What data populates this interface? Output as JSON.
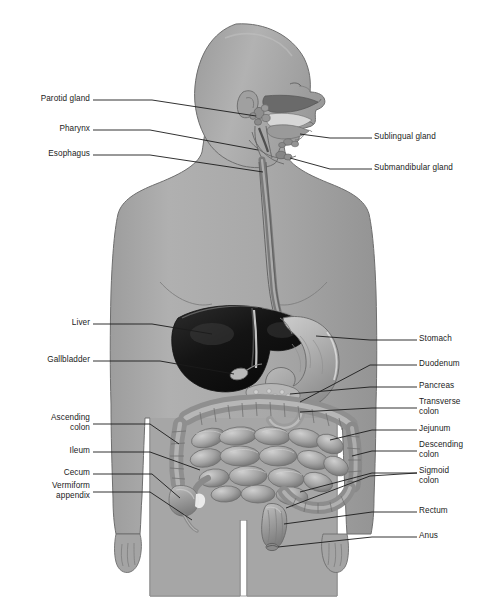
{
  "figure": {
    "title_fragment": "",
    "background_color": "#ffffff",
    "body_fill": "#a9a9a9",
    "body_outline": "#6d6d6d",
    "liver_color": "#1d1d1d",
    "stomach_color": "#b4b4b4",
    "intestine_color": "#9b9b9b",
    "leader_color": "#1b1b1b",
    "label_color": "#1b1b1b"
  },
  "labels_left": [
    {
      "name": "parotid-gland",
      "text": "Parotid gland",
      "x": 14,
      "y": 96,
      "w": 76,
      "lines": 1
    },
    {
      "name": "pharynx",
      "text": "Pharynx",
      "x": 14,
      "y": 126,
      "w": 76,
      "lines": 1
    },
    {
      "name": "esophagus",
      "text": "Esophagus",
      "x": 14,
      "y": 151,
      "w": 76,
      "lines": 1
    },
    {
      "name": "liver",
      "text": "Liver",
      "x": 14,
      "y": 320,
      "w": 76,
      "lines": 1
    },
    {
      "name": "gallbladder",
      "text": "Gallbladder",
      "x": 14,
      "y": 357,
      "w": 76,
      "lines": 1
    },
    {
      "name": "ascending-colon",
      "text": "Ascending\ncolon",
      "x": 14,
      "y": 419,
      "w": 76,
      "lines": 2
    },
    {
      "name": "ileum",
      "text": "Ileum",
      "x": 14,
      "y": 448,
      "w": 76,
      "lines": 1
    },
    {
      "name": "cecum",
      "text": "Cecum",
      "x": 14,
      "y": 470,
      "w": 76,
      "lines": 1
    },
    {
      "name": "vermiform-appendix",
      "text": "Vermiform\nappendix",
      "x": 14,
      "y": 487,
      "w": 76,
      "lines": 2
    }
  ],
  "labels_right": [
    {
      "name": "sublingual-gland",
      "text": "Sublingual gland",
      "x": 374,
      "y": 134,
      "lines": 1
    },
    {
      "name": "submandibular-gland",
      "text": "Submandibular gland",
      "x": 374,
      "y": 165,
      "lines": 1
    },
    {
      "name": "stomach",
      "text": "Stomach",
      "x": 419,
      "y": 336,
      "lines": 1
    },
    {
      "name": "duodenum",
      "text": "Duodenum",
      "x": 419,
      "y": 361,
      "lines": 1
    },
    {
      "name": "pancreas",
      "text": "Pancreas",
      "x": 419,
      "y": 383,
      "lines": 1
    },
    {
      "name": "transverse-colon",
      "text": "Transverse\ncolon",
      "x": 419,
      "y": 400,
      "lines": 2
    },
    {
      "name": "jejunum",
      "text": "Jejunum",
      "x": 419,
      "y": 426,
      "lines": 1
    },
    {
      "name": "descending-colon",
      "text": "Descending\ncolon",
      "x": 419,
      "y": 443,
      "lines": 2
    },
    {
      "name": "sigmoid-colon",
      "text": "Sigmoid\ncolon",
      "x": 419,
      "y": 469,
      "lines": 2
    },
    {
      "name": "rectum",
      "text": "Rectum",
      "x": 419,
      "y": 508,
      "lines": 1
    },
    {
      "name": "anus",
      "text": "Anus",
      "x": 419,
      "y": 533,
      "lines": 1
    }
  ]
}
